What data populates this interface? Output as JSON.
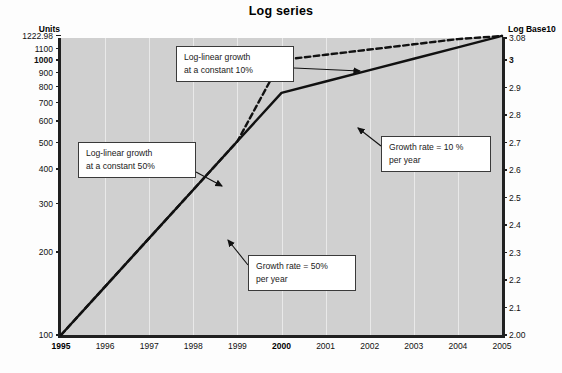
{
  "chart_data": {
    "type": "line",
    "title": "Log series",
    "xlabel": "",
    "ylabel": "Units",
    "ylabel_right": "Log Base10",
    "x": [
      "1995",
      "1996",
      "1997",
      "1998",
      "1999",
      "2000",
      "2001",
      "2002",
      "2003",
      "2004",
      "2005"
    ],
    "xlim": [
      1995,
      2005
    ],
    "y_scale": "log10",
    "ylim": [
      100,
      1222.98
    ],
    "ylim_log": [
      2.0,
      3.08
    ],
    "grid": "vertical-only",
    "legend": "none",
    "bold_x_ticks": [
      "1995",
      "2000"
    ],
    "bold_y_ticks_left": [
      "1000"
    ],
    "bold_y_ticks_right": [
      "3"
    ],
    "yticks_left": [
      "1222.98",
      "1100",
      "1000",
      "900",
      "800",
      "700",
      "600",
      "500",
      "400",
      "300",
      "200",
      "100"
    ],
    "yticks_left_values": [
      1222.98,
      1100,
      1000,
      900,
      800,
      700,
      600,
      500,
      400,
      300,
      200,
      100
    ],
    "yticks_right": [
      "3.08",
      "3",
      "2.9",
      "2.8",
      "2.7",
      "2.6",
      "2.5",
      "2.4",
      "2.3",
      "2.2",
      "2.1",
      "2.00"
    ],
    "yticks_right_values": [
      3.08,
      3.0,
      2.9,
      2.8,
      2.7,
      2.6,
      2.5,
      2.4,
      2.3,
      2.2,
      2.1,
      2.0
    ],
    "series": [
      {
        "name": "Log-linear growth (50% then 10%)",
        "style": "dashed",
        "color": "#111111",
        "values": [
          100,
          150,
          225,
          337.5,
          506.25,
          1000,
          1044.8,
          1091.6,
          1140.4,
          1191.4,
          1222.98
        ]
      },
      {
        "name": "Actual series (50% per year then 10% per year)",
        "style": "solid",
        "color": "#111111",
        "values": [
          100,
          150,
          225,
          337.5,
          506.25,
          759.4,
          835.3,
          918.8,
          1010.7,
          1111.8,
          1222.98
        ]
      }
    ],
    "annotations": [
      {
        "id": "callout-log-linear-10",
        "text": "Log-linear growth\nat a constant 10%",
        "points_to": "dashed-series-at-2001"
      },
      {
        "id": "callout-log-linear-50",
        "text": "Log-linear growth\nat a constant 50%",
        "points_to": "dashed-series-at-1998"
      },
      {
        "id": "callout-growth-10",
        "text": "Growth rate = 10 %\nper year",
        "points_to": "solid-series-at-2002"
      },
      {
        "id": "callout-growth-50",
        "text": "Growth rate = 50%\nper year",
        "points_to": "solid-series-at-1999"
      }
    ]
  }
}
